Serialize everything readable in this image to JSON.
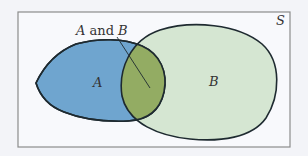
{
  "diagram": {
    "type": "venn",
    "universe_label": "S",
    "sets": [
      {
        "id": "A",
        "label": "A",
        "color": "#6fa5cf"
      },
      {
        "id": "B",
        "label": "B",
        "color": "#d5e6d2"
      }
    ],
    "intersection": {
      "label_italic_a": "A",
      "label_and": " and ",
      "label_italic_b": "B",
      "color": "#93ac63"
    },
    "colors": {
      "background": "#f3f4f8",
      "frame_fill": "#f8f9fc",
      "frame_stroke": "#8c8c8c",
      "outline": "#1e2a30"
    }
  }
}
